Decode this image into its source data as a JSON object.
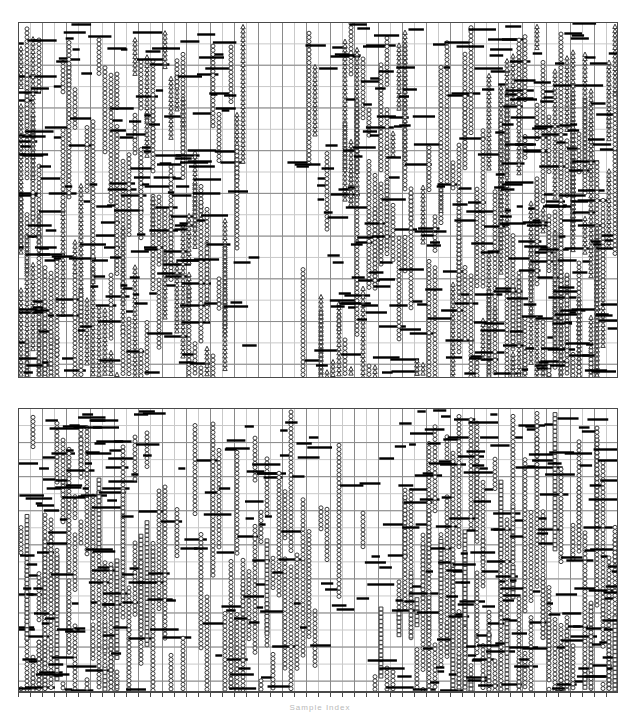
{
  "figure": {
    "width": 640,
    "height": 716,
    "background": "#ffffff",
    "xlabel": "Sample Index"
  },
  "style": {
    "grid_color": "#8a8a8a",
    "grid_minor_color": "#c9c9c9",
    "axis_color": "#4a4a4a",
    "marker_line_color": "#111111",
    "marker_open_edge": "#3a3a3a",
    "marker_open_fill": "#ffffff",
    "dash_color": "#000000",
    "xlabel_color": "#b9b9b9"
  },
  "chart_data": {
    "type": "scatter",
    "title": "",
    "subtitle": "",
    "xlabel": "Sample Index",
    "ylabel": "",
    "grid": true,
    "legend": "none",
    "panels": [
      {
        "name": "upper-panel",
        "x": 18,
        "y": 22,
        "width": 600,
        "height": 356,
        "xlim": [
          0,
          300
        ],
        "ylim": [
          0,
          100
        ],
        "x_major_step": 6,
        "y_major_step": 6,
        "density": 0.62,
        "seed": 20873,
        "series": [
          {
            "name": "series-circle",
            "marker": "circle",
            "count": 1650,
            "color": "#3a3a3a"
          },
          {
            "name": "series-triangle",
            "marker": "triangle",
            "count": 900,
            "color": "#3a3a3a"
          },
          {
            "name": "series-dash",
            "marker": "dash",
            "count": 1100,
            "color": "#000000"
          }
        ]
      },
      {
        "name": "lower-panel",
        "x": 18,
        "y": 408,
        "width": 600,
        "height": 284,
        "xlim": [
          0,
          300
        ],
        "ylim": [
          0,
          100
        ],
        "x_major_step": 6,
        "y_major_step": 6,
        "density": 0.45,
        "seed": 55119,
        "series": [
          {
            "name": "series-circle",
            "marker": "circle",
            "count": 1500,
            "color": "#3a3a3a"
          },
          {
            "name": "series-dash",
            "marker": "dash",
            "count": 1150,
            "color": "#000000"
          },
          {
            "name": "series-square",
            "marker": "square",
            "count": 260,
            "color": "#2a2a2a"
          }
        ]
      }
    ],
    "axis": {
      "name": "bottom-axis",
      "x": 18,
      "y": 692,
      "width": 600,
      "tick_count": 50,
      "tick_length": 5
    },
    "x": [],
    "values": [],
    "categories": []
  }
}
